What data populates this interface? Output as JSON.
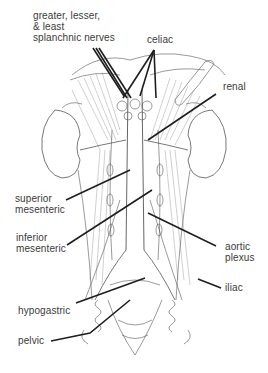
{
  "figure": {
    "labels": {
      "splanchnic": "greater, lesser,\n& least\nsplanchnic nerves",
      "celiac": "celiac",
      "renal": "renal",
      "superior_mesenteric": "superior\nmesenteric",
      "inferior_mesenteric": "inferior\nmesenteric",
      "aortic_plexus": "aortic\nplexus",
      "iliac": "iliac",
      "hypogastric": "hypogastric",
      "pelvic": "pelvic"
    },
    "colors": {
      "ink": "#2a2a2a",
      "label": "#3a3a3a",
      "background": "#ffffff"
    }
  }
}
